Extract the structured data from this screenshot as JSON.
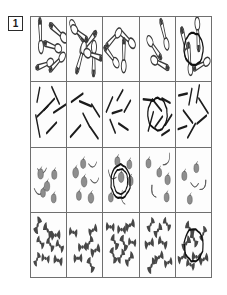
{
  "figure": {
    "label": "1",
    "label_name": "figure-number-1"
  },
  "grid": {
    "columns": 5,
    "rows": 4,
    "colors": {
      "cell_border": "#6f6f6f",
      "spoon_outline": "#3a3a3a",
      "spoon_fill": "#ffffff",
      "rod_fill": "#1c1c1c",
      "apple_fill": "#8e8e8e",
      "apple_outline": "#4a4a4a",
      "banana_fill": "#d8d8d8",
      "banana_outline": "#5a5a5a",
      "bowtie_fill": "#474747",
      "marker_circle": "#111111",
      "page_background": "#ffffff"
    },
    "rows_data": [
      {
        "row_index": 1,
        "item_type": "spoon",
        "item_name": "spoon-shape",
        "counts": [
          5,
          6,
          4,
          3,
          4
        ],
        "circled_cell": 5,
        "circle_count": 1
      },
      {
        "row_index": 2,
        "item_type": "rod",
        "item_name": "rod-shape",
        "counts": [
          7,
          6,
          6,
          7,
          8
        ],
        "circled_cell": 4,
        "circle_count": 1
      },
      {
        "row_index": 3,
        "item_type": "apple-and-banana",
        "item_name": "fruit-shape",
        "counts": [
          7,
          7,
          7,
          6,
          5
        ],
        "circled_cell": 3,
        "circle_count": 2
      },
      {
        "row_index": 4,
        "item_type": "bowtie",
        "item_name": "bowtie-shape",
        "counts": [
          9,
          7,
          9,
          8,
          8
        ],
        "circled_cell": 5,
        "circle_count": 1
      }
    ]
  }
}
